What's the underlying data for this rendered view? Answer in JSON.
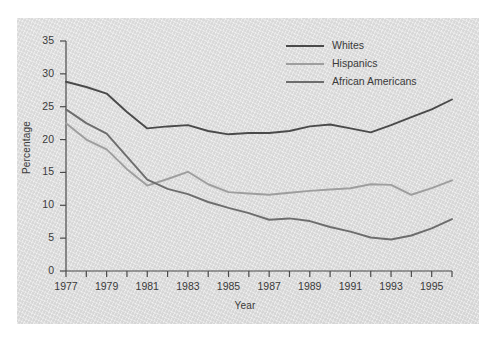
{
  "chart_data": {
    "type": "line",
    "title": "",
    "xlabel": "Year",
    "ylabel": "Percentage",
    "xlim": [
      1977,
      1996
    ],
    "ylim": [
      0,
      35
    ],
    "yticks": [
      0,
      5,
      10,
      15,
      20,
      25,
      30,
      35
    ],
    "xticks": [
      1977,
      1978,
      1979,
      1980,
      1981,
      1982,
      1983,
      1984,
      1985,
      1986,
      1987,
      1988,
      1989,
      1990,
      1991,
      1992,
      1993,
      1994,
      1995,
      1996
    ],
    "xtick_labels": [
      "1977",
      "",
      "1979",
      "",
      "1981",
      "",
      "1983",
      "",
      "1985",
      "",
      "1987",
      "",
      "1989",
      "",
      "1991",
      "",
      "1993",
      "",
      "1995",
      ""
    ],
    "grid": false,
    "legend_position": "top-right",
    "x": [
      1977,
      1978,
      1979,
      1980,
      1981,
      1982,
      1983,
      1984,
      1985,
      1986,
      1987,
      1988,
      1989,
      1990,
      1991,
      1992,
      1993,
      1994,
      1995,
      1996
    ],
    "series": [
      {
        "name": "Whites",
        "color": "#4a4a4a",
        "values": [
          28.8,
          28.0,
          27.0,
          24.2,
          21.7,
          22.0,
          22.2,
          21.3,
          20.8,
          21.0,
          21.0,
          21.3,
          22.0,
          22.3,
          21.7,
          21.1,
          22.2,
          23.4,
          24.6,
          26.1
        ]
      },
      {
        "name": "Hispanics",
        "color": "#9e9e9e",
        "values": [
          22.5,
          20.0,
          18.5,
          15.5,
          13.0,
          14.0,
          15.1,
          13.2,
          12.0,
          11.8,
          11.6,
          11.9,
          12.2,
          12.4,
          12.6,
          13.2,
          13.1,
          11.6,
          12.6,
          13.8
        ]
      },
      {
        "name": "African Americans",
        "color": "#6d6d6d",
        "values": [
          24.6,
          22.5,
          20.9,
          17.4,
          13.9,
          12.5,
          11.7,
          10.5,
          9.6,
          8.8,
          7.8,
          8.0,
          7.6,
          6.7,
          6.0,
          5.1,
          4.8,
          5.4,
          6.5,
          7.9
        ]
      }
    ]
  },
  "legend": {
    "items": [
      {
        "label": "Whites"
      },
      {
        "label": "Hispanics"
      },
      {
        "label": "African Americans"
      }
    ]
  },
  "axes": {
    "y_title": "Percentage",
    "x_title": "Year"
  }
}
